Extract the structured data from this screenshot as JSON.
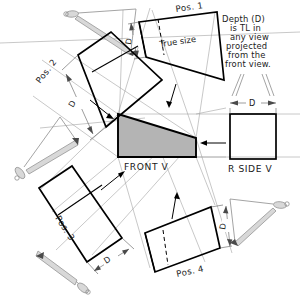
{
  "figure": {
    "title_note": "Depth (D) is TL in any view projected from the front view.",
    "note_lines": [
      "Depth (D)",
      "is TL in",
      "any view",
      "projected",
      "from the",
      "front view."
    ],
    "background": "#ffffff",
    "ink": "#000000",
    "wedge_fill": "#b4b4b4",
    "projection_line_color": "#9a9a9a",
    "viewing_symbol_color": "#8d8d8d"
  },
  "views": {
    "front": {
      "label": "FRONT V",
      "shape": "wedge-trapezoid",
      "fill": "#b4b4b4"
    },
    "rside": {
      "label": "R SIDE V",
      "shape": "square",
      "fill": "#ffffff"
    }
  },
  "positions": [
    {
      "id": "pos1",
      "label": "Pos. 1",
      "annotation": "True size",
      "dim": "D",
      "has_hidden_line": true
    },
    {
      "id": "pos2",
      "label": "Pos. 2",
      "annotation": "",
      "dim": "D",
      "has_hidden_line": false
    },
    {
      "id": "pos3",
      "label": "Pos. 3",
      "annotation": "",
      "dim": "D",
      "has_hidden_line": false
    },
    {
      "id": "pos4",
      "label": "Pos. 4",
      "annotation": "",
      "dim": "D",
      "has_hidden_line": true
    }
  ],
  "dimensions": {
    "rside_depth": "D",
    "pos1_depth": "D",
    "pos2_depth": "D",
    "pos3_depth": "D",
    "pos4_depth": "D"
  },
  "labels": {
    "true_size": "True size",
    "front_v": "FRONT V",
    "r_side_v": "R SIDE V",
    "pos1": "Pos. 1",
    "pos2": "Pos. 2",
    "pos3": "Pos. 3",
    "pos4": "Pos. 4",
    "d": "D"
  }
}
